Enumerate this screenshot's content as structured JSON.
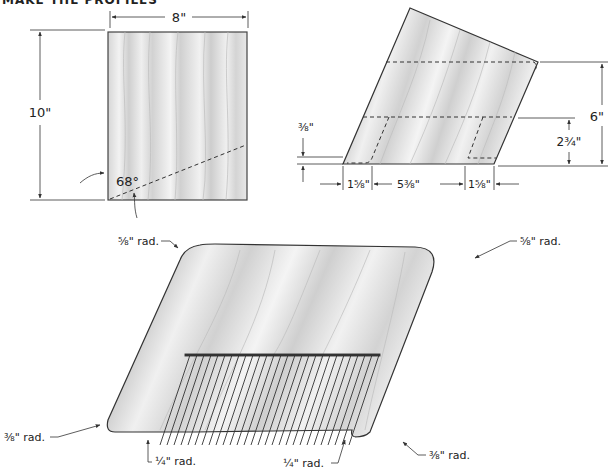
{
  "heading": "MAKE THE PROFILES",
  "blank": {
    "width_label": "8\"",
    "height_label": "10\"",
    "angle_label": "68°"
  },
  "cut_piece": {
    "left_corner_offset_label": "⅜\"",
    "bottom_left_label": "1⅝\"",
    "bottom_middle_label": "5⅜\"",
    "bottom_right_label": "1⅝\"",
    "inner_height_label": "2¾\"",
    "total_height_label": "6\""
  },
  "comb": {
    "top_left_radius": "⅝\" rad.",
    "top_right_radius": "⅝\" rad.",
    "bottom_left_radius": "⅜\" rad.",
    "bottom_right_radius": "⅜\" rad.",
    "teeth_left_radius": "¼\" rad.",
    "teeth_right_radius": "¼\" rad.",
    "tooth_count": 26
  },
  "colors": {
    "wood_light": "#efefef",
    "wood_grain": "#c8c8c8",
    "outline": "#333333"
  }
}
